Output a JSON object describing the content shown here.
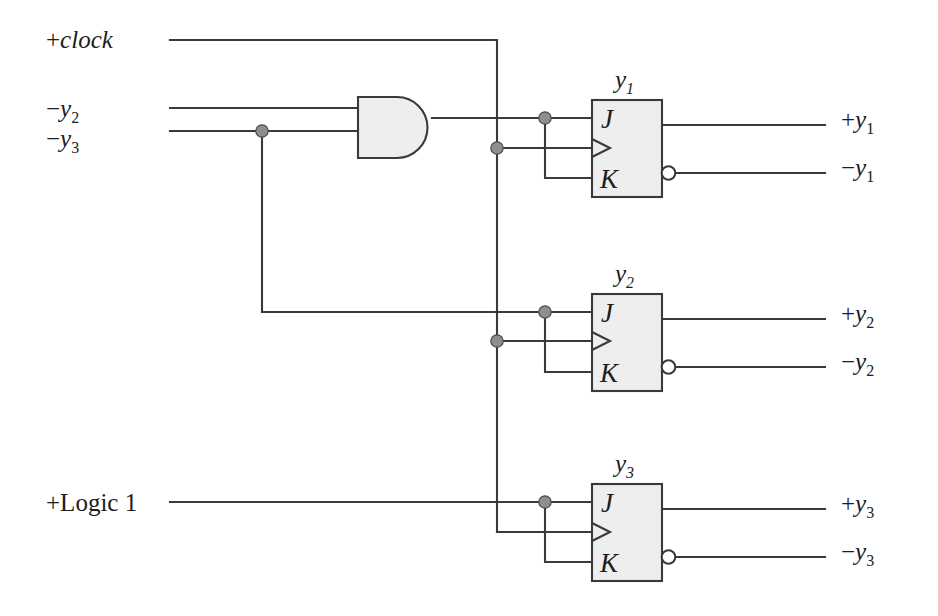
{
  "diagram": {
    "canvas": {
      "width": 938,
      "height": 616
    },
    "colors": {
      "background": "#ffffff",
      "wire": "#3a3a3a",
      "gate_fill": "#eeeeee",
      "junction": "#8e8e8e",
      "bubble_fill": "#ffffff",
      "text": "#1d1d1d"
    }
  },
  "inputs": [
    {
      "id": "clock",
      "sign": "+",
      "name": "clock",
      "subscript": "",
      "italic": true,
      "x": 46,
      "y": 48
    },
    {
      "id": "ny2",
      "sign": "−",
      "name": "y",
      "subscript": "2",
      "italic": true,
      "x": 46,
      "y": 117
    },
    {
      "id": "ny3",
      "sign": "−",
      "name": "y",
      "subscript": "3",
      "italic": true,
      "x": 46,
      "y": 147
    },
    {
      "id": "logic1",
      "sign": "+",
      "name": "Logic 1",
      "subscript": "",
      "italic": false,
      "x": 46,
      "y": 511
    }
  ],
  "outputs": [
    {
      "id": "py1",
      "sign": "+",
      "name": "y",
      "subscript": "1",
      "x": 841,
      "y": 128
    },
    {
      "id": "ny1",
      "sign": "−",
      "name": "y",
      "subscript": "1",
      "x": 841,
      "y": 176
    },
    {
      "id": "py2",
      "sign": "+",
      "name": "y",
      "subscript": "2",
      "x": 841,
      "y": 322
    },
    {
      "id": "ny2o",
      "sign": "−",
      "name": "y",
      "subscript": "2",
      "x": 841,
      "y": 370
    },
    {
      "id": "py3",
      "sign": "+",
      "name": "y",
      "subscript": "3",
      "x": 841,
      "y": 512
    },
    {
      "id": "ny3o",
      "sign": "−",
      "name": "y",
      "subscript": "3",
      "x": 841,
      "y": 560
    }
  ],
  "gates": [
    {
      "id": "and1",
      "type": "AND",
      "label": "",
      "inputs": [
        "−y2",
        "−y3"
      ],
      "output": "J/K of y1"
    }
  ],
  "flipflops": [
    {
      "id": "ff1",
      "type": "JK",
      "title": "y",
      "title_sub": "1",
      "pins": {
        "j": "J",
        "k": "K",
        "clock": "clock-triangle"
      },
      "box": {
        "x": 592,
        "y": 100,
        "w": 70,
        "h": 97
      },
      "q_out": "+y1",
      "qbar_out": "−y1",
      "jk_source": "AND gate output"
    },
    {
      "id": "ff2",
      "type": "JK",
      "title": "y",
      "title_sub": "2",
      "pins": {
        "j": "J",
        "k": "K",
        "clock": "clock-triangle"
      },
      "box": {
        "x": 592,
        "y": 294,
        "w": 70,
        "h": 97
      },
      "q_out": "+y2",
      "qbar_out": "−y2",
      "jk_source": "−y3"
    },
    {
      "id": "ff3",
      "type": "JK",
      "title": "y",
      "title_sub": "3",
      "pins": {
        "j": "J",
        "k": "K",
        "clock": "clock-triangle"
      },
      "box": {
        "x": 592,
        "y": 484,
        "w": 70,
        "h": 97
      },
      "q_out": "+y3",
      "qbar_out": "−y3",
      "jk_source": "+Logic 1"
    }
  ],
  "junction_count": 7,
  "clock_bus": {
    "x": 497,
    "y_top": 40,
    "y_bottom": 532
  }
}
